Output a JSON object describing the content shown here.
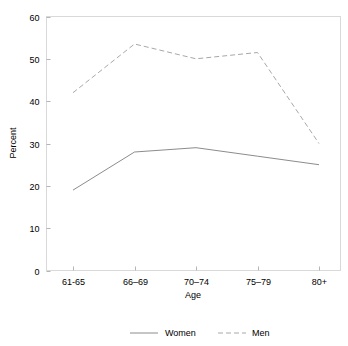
{
  "chart_data": {
    "type": "line",
    "title": "",
    "xlabel": "Age",
    "ylabel": "Percent",
    "categories": [
      "61-65",
      "66–69",
      "70–74",
      "75–79",
      "80+"
    ],
    "series": [
      {
        "name": "Women",
        "style": "solid",
        "color": "#8c8c8c",
        "values": [
          19,
          28,
          29,
          27,
          25
        ]
      },
      {
        "name": "Men",
        "style": "dashed",
        "color": "#a8a8a8",
        "values": [
          42,
          53.5,
          50,
          51.5,
          30
        ]
      }
    ],
    "ylim": [
      0,
      60
    ],
    "yticks": [
      0,
      10,
      20,
      30,
      40,
      50,
      60
    ],
    "ytick_labels": [
      "0",
      "10",
      "20",
      "30",
      "40",
      "50",
      "60"
    ],
    "grid": false,
    "legend_position": "bottom"
  },
  "axes": {
    "y_title": "Percent",
    "x_title": "Age"
  },
  "legend": {
    "items": [
      {
        "label": "Women",
        "style": "solid"
      },
      {
        "label": "Men",
        "style": "dashed"
      }
    ]
  },
  "colors": {
    "background": "#ffffff",
    "frame": "#d9d9d9",
    "women_line": "#8c8c8c",
    "men_line": "#a8a8a8",
    "text": "#000000"
  }
}
